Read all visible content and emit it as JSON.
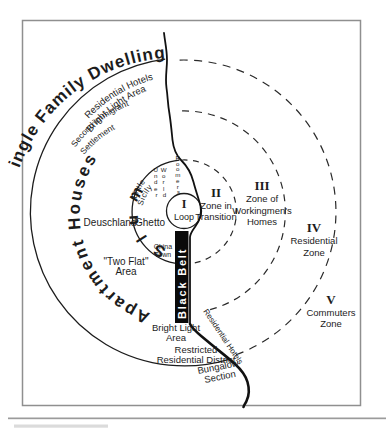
{
  "figure": {
    "ring_labels": {
      "single_family_dwellings": "Single Family Dwellings",
      "residential_hotels": "Residential Hotels",
      "bright_light_area": "Bright Light Area",
      "second_immigrant": "Second Immigrant",
      "settlement": "Settlement",
      "apartment_houses": "Apartment Houses"
    },
    "zones": [
      {
        "numeral": "I",
        "lines": [
          "Loop"
        ]
      },
      {
        "numeral": "II",
        "lines": [
          "Zone in",
          "Transition"
        ]
      },
      {
        "numeral": "III",
        "lines": [
          "Zone of",
          "Workingmen's",
          "Homes"
        ]
      },
      {
        "numeral": "IV",
        "lines": [
          "Residential",
          "Zone"
        ]
      },
      {
        "numeral": "V",
        "lines": [
          "Commuters",
          "Zone"
        ]
      }
    ],
    "inner_labels": {
      "slum": "Slum",
      "little": "Little",
      "sicily": "Sicily",
      "ghetto": "Ghetto",
      "deutschland": "Deuschland",
      "china": "China",
      "town": "Town",
      "under": [
        "U",
        "n",
        "d",
        "e",
        "r"
      ],
      "world": [
        "W",
        "o",
        "r",
        "l",
        "d"
      ],
      "roomers": [
        "R",
        "o",
        "o",
        "m",
        "e",
        "r",
        "s"
      ]
    },
    "area_labels": {
      "two_flat": "\"Two Flat\"",
      "two_flat_area": "Area",
      "black_belt": "Black Belt",
      "bright_light": "Bright Light",
      "bright_light_area": "Area",
      "restricted": "Restricted",
      "restricted_district": "Residential District",
      "bungalow": "Bungalow",
      "bungalow_section": "Section",
      "shore_residential_hotels": "Residential Hotels"
    }
  }
}
